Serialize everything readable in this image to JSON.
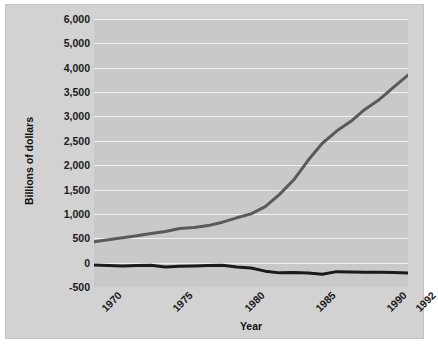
{
  "chart_data": {
    "type": "line",
    "title": "",
    "xlabel": "Year",
    "ylabel": "Billions of dollars",
    "grid": true,
    "legend": "none",
    "xlim": [
      1970,
      1992
    ],
    "xticks": [
      "1970",
      "1975",
      "1980",
      "1985",
      "1990",
      "1992"
    ],
    "xtick_values": [
      1970,
      1975,
      1980,
      1985,
      1990,
      1992
    ],
    "yticks": [
      "-500",
      "0",
      "500",
      "1,000",
      "1,500",
      "2,000",
      "2,500",
      "3,000",
      "3,500",
      "4,000",
      "5,000",
      "6,000"
    ],
    "ytick_values": [
      -500,
      0,
      500,
      1000,
      1500,
      2000,
      2500,
      3000,
      3500,
      4000,
      5000,
      6000
    ],
    "y_axis_note": "non-linear: equal spacing between all listed ticks; 4,000-5,000-6,000 compressed",
    "x": [
      1970,
      1971,
      1972,
      1973,
      1974,
      1975,
      1976,
      1977,
      1978,
      1979,
      1980,
      1981,
      1982,
      1983,
      1984,
      1985,
      1986,
      1987,
      1988,
      1989,
      1990,
      1991,
      1992
    ],
    "series": [
      {
        "name": "upper-series",
        "color": "#5a5a5a",
        "width": 3,
        "values": [
          430,
          470,
          510,
          550,
          600,
          640,
          700,
          720,
          760,
          830,
          920,
          1000,
          1150,
          1400,
          1700,
          2100,
          2450,
          2700,
          2900,
          3150,
          3350,
          3600,
          3850
        ]
      },
      {
        "name": "lower-series",
        "color": "#1a1a1a",
        "width": 3,
        "values": [
          -50,
          -60,
          -70,
          -60,
          -55,
          -90,
          -75,
          -70,
          -60,
          -55,
          -90,
          -110,
          -175,
          -210,
          -200,
          -215,
          -240,
          -185,
          -190,
          -195,
          -195,
          -200,
          -215
        ]
      }
    ]
  }
}
